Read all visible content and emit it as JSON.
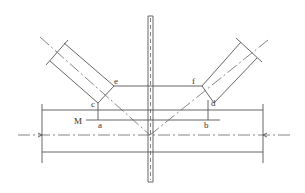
{
  "diagram": {
    "type": "engineering-drawing",
    "labels": {
      "M": "M",
      "a": "a",
      "b": "b",
      "c": "c",
      "d": "d",
      "e": "e",
      "f": "f"
    },
    "colors": {
      "line": "#555555",
      "background": "#ffffff"
    }
  }
}
